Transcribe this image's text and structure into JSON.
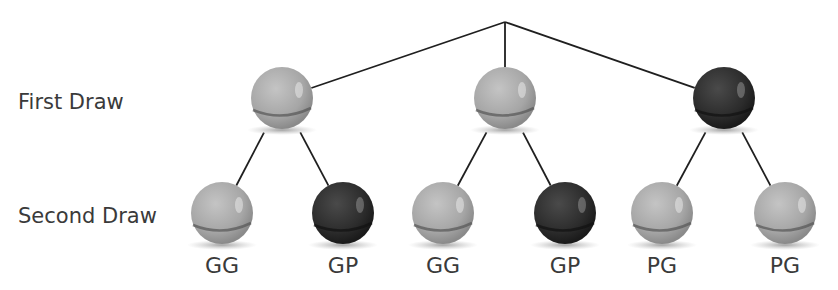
{
  "row_labels": {
    "first": "First Draw",
    "second": "Second Draw"
  },
  "colors": {
    "gray_ball": "#a8a8a8",
    "dark_ball": "#2e2e2e",
    "line": "#1f1f1f"
  },
  "tree": {
    "root": {
      "x": 505,
      "y": 22
    },
    "first_draw": [
      {
        "id": "g1",
        "color": "gray",
        "x": 282,
        "y": 98
      },
      {
        "id": "g2",
        "color": "gray",
        "x": 505,
        "y": 98
      },
      {
        "id": "p1",
        "color": "dark",
        "x": 724,
        "y": 98
      }
    ],
    "second_draw": [
      {
        "parent": 0,
        "color": "gray",
        "x": 222,
        "y": 213,
        "label": "GG"
      },
      {
        "parent": 0,
        "color": "dark",
        "x": 343,
        "y": 213,
        "label": "GP"
      },
      {
        "parent": 1,
        "color": "gray",
        "x": 443,
        "y": 213,
        "label": "GG"
      },
      {
        "parent": 1,
        "color": "dark",
        "x": 565,
        "y": 213,
        "label": "GP"
      },
      {
        "parent": 2,
        "color": "gray",
        "x": 662,
        "y": 213,
        "label": "PG"
      },
      {
        "parent": 2,
        "color": "gray",
        "x": 785,
        "y": 213,
        "label": "PG"
      }
    ]
  },
  "outcomes": [
    "GG",
    "GP",
    "GG",
    "GP",
    "PG",
    "PG"
  ]
}
